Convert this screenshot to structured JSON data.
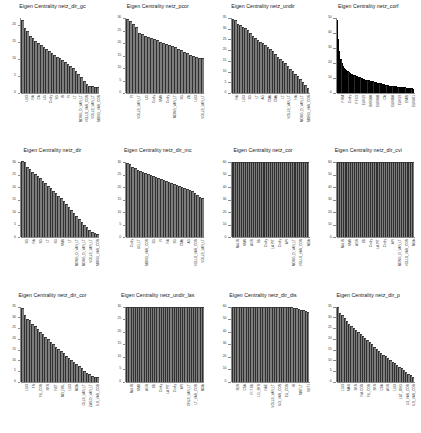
{
  "figure": {
    "title_prefix": "Eigen Centrality",
    "rows": 3,
    "cols": 4,
    "bar_color": "#7d7d7d",
    "bar_color_dark": "#2b2b2b",
    "axis_color": "#8a8a8a"
  },
  "chart_data": [
    {
      "type": "bar",
      "title": "Eigen Centrality netz_dir_gc",
      "xlabel": "",
      "ylabel": "",
      "ylim": [
        0,
        22
      ],
      "yticks": [
        0,
        5,
        10,
        15,
        20
      ],
      "ytick_labels": [
        "0",
        "5",
        "10",
        "15",
        "20"
      ],
      "grid": false,
      "legend": "none",
      "categories": [
        "LBO",
        "RA",
        "CA",
        "UG",
        "Cndty",
        "SG",
        "IR",
        "FI",
        "LT",
        "MORG_D_VAR_LT",
        "VOLLS_VAR_COR",
        "VOLLS_VAR_LT",
        "MORG_VAR_COR"
      ],
      "values": [
        21.4,
        19.1,
        18.2,
        16.8,
        16.0,
        15.2,
        14.6,
        14.0,
        13.4,
        12.8,
        12.2,
        11.7,
        11.2,
        10.7,
        10.2,
        9.7,
        9.2,
        8.6,
        8.0,
        7.3,
        6.5,
        5.6,
        4.6,
        3.4,
        2.6,
        2.2,
        2.0,
        1.9,
        1.8
      ]
    },
    {
      "type": "bar",
      "title": "Eigen Centrality netz_pcor",
      "xlabel": "",
      "ylabel": "",
      "ylim": [
        0,
        30
      ],
      "yticks": [
        0,
        5,
        10,
        15,
        20,
        25,
        30
      ],
      "ytick_labels": [
        "0",
        "5",
        "10",
        "15",
        "20",
        "25",
        "30"
      ],
      "grid": false,
      "legend": "none",
      "categories": [
        "FI",
        "VOLLS_VAR_LT",
        "UG",
        "Cndty",
        "NMR",
        "Cndty",
        "MORG_VAR_LT",
        "SG",
        "ZA",
        "LBO",
        "VOLLS_VAR_LT"
      ],
      "values": [
        29.8,
        29.0,
        27.6,
        26.4,
        24.2,
        23.6,
        23.0,
        22.6,
        22.2,
        21.8,
        21.2,
        20.6,
        20.2,
        19.8,
        19.4,
        19.0,
        18.4,
        17.8,
        17.2,
        16.6,
        16.0,
        15.4,
        14.8,
        14.4,
        14.2,
        14.0
      ]
    },
    {
      "type": "bar",
      "title": "Eigen Centrality netz_undir",
      "xlabel": "",
      "ylabel": "",
      "ylim": [
        0,
        35
      ],
      "yticks": [
        0,
        5,
        10,
        15,
        20,
        25,
        30,
        35
      ],
      "ytick_labels": [
        "0",
        "5",
        "10",
        "15",
        "20",
        "25",
        "30",
        "35"
      ],
      "grid": false,
      "legend": "none",
      "categories": [
        "RA",
        "LBO",
        "SG",
        "LT",
        "AG",
        "CMA",
        "CMA",
        "LT",
        "VOLLS_VAR_LT",
        "HA",
        "MORG_D_VAR_LT",
        "MORG_VAR_COR"
      ],
      "values": [
        34.4,
        34.0,
        32.2,
        31.6,
        31.0,
        30.2,
        29.4,
        28.2,
        26.8,
        25.6,
        24.8,
        24.0,
        23.2,
        22.4,
        21.4,
        20.4,
        19.4,
        18.2,
        17.0,
        16.0,
        15.0,
        13.8,
        12.6,
        11.4,
        10.2,
        9.0,
        7.8,
        6.4,
        5.0,
        3.6,
        2.4
      ]
    },
    {
      "type": "bar",
      "title": "Eigen Centrality netz_corf",
      "xlabel": "",
      "ylabel": "",
      "ylim": [
        0,
        50
      ],
      "yticks": [
        0,
        10,
        20,
        30,
        40,
        50
      ],
      "ytick_labels": [
        "0",
        "10",
        "20",
        "30",
        "40",
        "50"
      ],
      "grid": false,
      "legend": "none",
      "categories": [
        "F.RM",
        "Cndty",
        "F.FI.O",
        "EUR19",
        "DKK020",
        "EUR010",
        "CA",
        "EUR050",
        "EUR19",
        "EMIR",
        "EUR071"
      ],
      "values": [
        49.0,
        36.0,
        28.0,
        23.0,
        20.0,
        18.2,
        17.0,
        16.0,
        15.2,
        14.5,
        14.0,
        13.4,
        13.0,
        12.5,
        12.1,
        11.8,
        11.4,
        11.1,
        10.8,
        10.5,
        10.2,
        9.9,
        9.6,
        9.3,
        9.0,
        8.8,
        8.6,
        8.4,
        8.2,
        8.0,
        7.8,
        7.6,
        7.4,
        7.2,
        7.0,
        6.8,
        6.6,
        6.4,
        6.2,
        6.0,
        5.8,
        5.6,
        5.4,
        5.2,
        5.0,
        4.9,
        4.8,
        4.7,
        4.6,
        4.5,
        4.4,
        4.3,
        4.2,
        4.1,
        4.0,
        3.9,
        3.8,
        3.7,
        3.6,
        3.5,
        3.4,
        3.3,
        3.2,
        3.1,
        3.0
      ]
    },
    {
      "type": "bar",
      "title": "Eigen Centrality netz_dir",
      "xlabel": "",
      "ylabel": "",
      "ylim": [
        0,
        30
      ],
      "yticks": [
        0,
        5,
        10,
        15,
        20,
        25,
        30
      ],
      "ytick_labels": [
        "0",
        "5",
        "10",
        "15",
        "20",
        "25",
        "30"
      ],
      "grid": false,
      "legend": "none",
      "categories": [
        "SG",
        "RA",
        "SG",
        "LT",
        "SG",
        "NMR",
        "LT",
        "MORG_D_VAR_LT",
        "MORG_D_VAR_LT",
        "VOLLS_VAR_LT",
        "MORG_VAR_COR"
      ],
      "values": [
        30.4,
        30.0,
        28.0,
        27.2,
        26.2,
        25.2,
        24.4,
        23.6,
        22.6,
        21.6,
        20.6,
        19.6,
        18.6,
        17.6,
        16.6,
        15.6,
        14.4,
        13.2,
        12.0,
        10.8,
        9.6,
        8.4,
        7.2,
        6.0,
        5.0,
        4.0,
        3.0,
        2.2,
        1.6,
        1.2
      ]
    },
    {
      "type": "bar",
      "title": "Eigen Centrality netz_dir_mc",
      "xlabel": "",
      "ylabel": "",
      "ylim": [
        0,
        30
      ],
      "yticks": [
        0,
        5,
        10,
        15,
        20,
        25,
        30
      ],
      "ytick_labels": [
        "0",
        "5",
        "10",
        "15",
        "20",
        "25",
        "30"
      ],
      "grid": false,
      "legend": "none",
      "categories": [
        "Cndty",
        "UG_LT",
        "MORG_VAR_COR",
        "SG",
        "FI",
        "RA",
        "SG",
        "CMA",
        "AG",
        "VOLLS_VAR_COR",
        "VOLLS_VAR_LT"
      ],
      "values": [
        29.6,
        29.2,
        28.2,
        27.6,
        27.0,
        26.6,
        26.2,
        25.8,
        25.4,
        25.0,
        24.6,
        24.2,
        23.8,
        23.4,
        23.0,
        22.6,
        22.2,
        21.8,
        21.4,
        21.0,
        20.6,
        20.2,
        19.8,
        19.4,
        19.0,
        18.4,
        17.8,
        17.0,
        16.2,
        15.6
      ]
    },
    {
      "type": "bar",
      "title": "Eigen Centrality netz_cor",
      "xlabel": "",
      "ylabel": "",
      "ylim": [
        0,
        60
      ],
      "yticks": [
        0,
        10,
        20,
        30,
        40,
        50,
        60
      ],
      "ytick_labels": [
        "0",
        "10",
        "20",
        "30",
        "40",
        "50",
        "60"
      ],
      "grid": false,
      "legend": "none",
      "categories": [
        "Mol.IR",
        "NMR",
        "AGR",
        "SB",
        "Cndty",
        "LA.PIT",
        "Cndty",
        "API",
        "MORG_D_VAR_LT",
        "VOLLS_VAR_COR",
        "MGA"
      ],
      "values": [
        60,
        60,
        60,
        60,
        60,
        60,
        60,
        60,
        60,
        60,
        60,
        60,
        60,
        60,
        60,
        60,
        60,
        60,
        60,
        60,
        60,
        60,
        60,
        60,
        60,
        60,
        60,
        60,
        60,
        60,
        60,
        60,
        60,
        60,
        60,
        60,
        60,
        60,
        60,
        60
      ]
    },
    {
      "type": "bar",
      "title": "Eigen Centrality netz_dir_cvi",
      "xlabel": "",
      "ylabel": "",
      "ylim": [
        0,
        60
      ],
      "yticks": [
        0,
        10,
        20,
        30,
        40,
        50,
        60
      ],
      "ytick_labels": [
        "0",
        "10",
        "20",
        "30",
        "40",
        "50",
        "60"
      ],
      "grid": false,
      "legend": "none",
      "categories": [
        "Mol.IR",
        "NMR",
        "AGR",
        "SB",
        "Cndty",
        "LA.PIT",
        "Cndty",
        "API",
        "MORG_D_VAR_LT",
        "VOLLS_VAR_COR",
        "MGA"
      ],
      "values": [
        60,
        60,
        60,
        60,
        60,
        60,
        60,
        60,
        60,
        60,
        60,
        60,
        60,
        60,
        60,
        60,
        60,
        60,
        60,
        60,
        60,
        60,
        60,
        60,
        60,
        60,
        60,
        60,
        60,
        60,
        60,
        60,
        60,
        60,
        60,
        60,
        60,
        60,
        60,
        60
      ]
    },
    {
      "type": "bar",
      "title": "Eigen Centrality netz_dir_cor",
      "xlabel": "",
      "ylabel": "",
      "ylim": [
        0,
        35
      ],
      "yticks": [
        0,
        5,
        10,
        15,
        20,
        25,
        30,
        35
      ],
      "ytick_labels": [
        "0",
        "5",
        "10",
        "15",
        "20",
        "25",
        "30",
        "35"
      ],
      "grid": false,
      "legend": "none",
      "categories": [
        "LBO",
        "FR",
        "FU_COR",
        "SKR",
        "RET",
        "MO_DRL",
        "LBO",
        "MOA",
        "OLLS_VAR_LT",
        "ZAR.D_VAR_LT",
        "ILS_VAR_COR"
      ],
      "values": [
        34.6,
        31.0,
        29.4,
        29.0,
        27.0,
        25.8,
        24.6,
        23.4,
        22.2,
        21.0,
        19.8,
        18.6,
        17.4,
        16.2,
        15.2,
        14.2,
        13.2,
        12.2,
        11.2,
        10.2,
        9.2,
        8.2,
        7.2,
        6.2,
        5.2,
        4.2,
        3.4,
        2.8,
        2.4,
        2.0
      ]
    },
    {
      "type": "bar",
      "title": "Eigen Centrality netz_undir_las",
      "xlabel": "",
      "ylabel": "",
      "ylim": [
        0,
        30
      ],
      "yticks": [
        0,
        5,
        10,
        15,
        20,
        25,
        30
      ],
      "ytick_labels": [
        "0",
        "5",
        "10",
        "15",
        "20",
        "25",
        "30"
      ],
      "grid": false,
      "legend": "none",
      "categories": [
        "Mol.IR",
        "NMR",
        "AGR",
        "SB",
        "Cndty",
        "LA.PIT",
        "Cndty",
        "API",
        "ORLS_VAR_LT",
        "LT_VAR_COR",
        "MOA"
      ],
      "values": [
        30,
        30,
        30,
        30,
        30,
        30,
        30,
        30,
        30,
        30,
        30,
        30,
        30,
        30,
        30,
        30,
        30,
        30,
        30,
        30,
        30,
        30,
        30,
        30,
        30,
        30,
        30,
        30,
        30,
        30,
        30,
        30,
        30,
        30,
        30,
        30
      ]
    },
    {
      "type": "bar",
      "title": "Eigen Centrality netz_dir_dis",
      "xlabel": "",
      "ylabel": "",
      "ylim": [
        0,
        60
      ],
      "yticks": [
        0,
        10,
        20,
        30,
        40,
        50,
        60
      ],
      "ytick_labels": [
        "0",
        "10",
        "20",
        "30",
        "40",
        "50",
        "60"
      ],
      "grid": false,
      "legend": "none",
      "categories": [
        "SBR",
        "CSA",
        "FI.T.SB",
        "LG_SKR",
        "NAE",
        "VOLLS_VAR_LT",
        "ILO_VAR_COR",
        "EU_COR",
        "IR",
        "MRT.LT",
        "RET.I"
      ],
      "values": [
        60,
        60,
        60,
        60,
        60,
        60,
        60,
        60,
        60,
        60,
        60,
        60,
        60,
        60,
        60,
        60,
        60,
        60,
        60,
        60,
        60,
        60,
        60,
        60,
        60,
        59.4,
        59,
        58.6,
        58.2,
        57.6,
        57,
        56.4,
        55.6
      ]
    },
    {
      "type": "bar",
      "title": "Eigen Centrality netz_dir_p",
      "xlabel": "",
      "ylabel": "",
      "ylim": [
        0,
        35
      ],
      "yticks": [
        0,
        5,
        10,
        15,
        20,
        25,
        30,
        35
      ],
      "ytick_labels": [
        "0",
        "5",
        "10",
        "15",
        "20",
        "25",
        "30",
        "35"
      ],
      "grid": false,
      "legend": "none",
      "categories": [
        "LBO",
        "MAR",
        "SKR",
        "RA.COR",
        "FU_COR",
        "SKR",
        "CSA",
        "AGR",
        "LBO",
        "LBT_ORG",
        "LO_VAR_COR",
        "ILS_VAR_COR"
      ],
      "values": [
        34.8,
        32.0,
        31.0,
        29.6,
        28.4,
        27.0,
        25.8,
        25.0,
        24.2,
        23.4,
        22.4,
        21.4,
        20.4,
        19.4,
        18.4,
        17.4,
        16.4,
        15.4,
        14.4,
        13.4,
        12.6,
        11.8,
        11.0,
        10.2,
        9.4,
        8.6,
        7.8,
        7.0,
        6.2,
        5.4,
        4.6,
        3.8,
        3.0,
        2.2
      ]
    }
  ]
}
